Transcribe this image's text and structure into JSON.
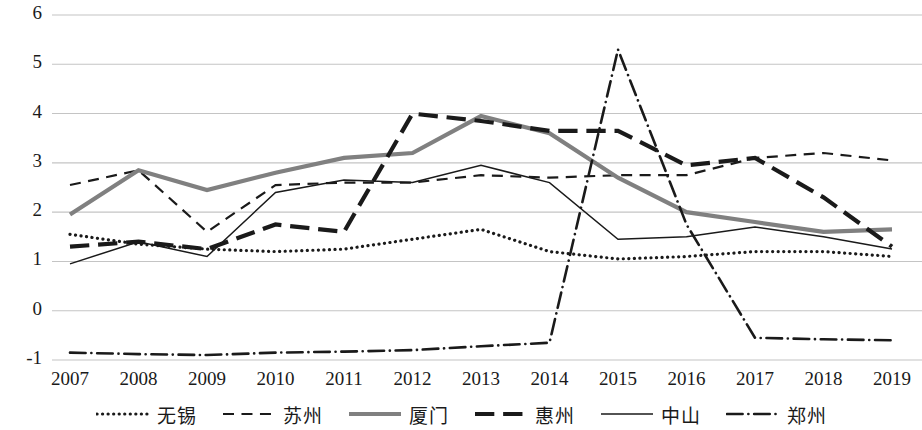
{
  "chart_data": {
    "type": "line",
    "title": "",
    "subtitle": "",
    "xlabel": "",
    "ylabel": "",
    "categories": [
      "2007",
      "2008",
      "2009",
      "2010",
      "2011",
      "2012",
      "2013",
      "2014",
      "2015",
      "2016",
      "2017",
      "2018",
      "2019"
    ],
    "x": [
      2007,
      2008,
      2009,
      2010,
      2011,
      2012,
      2013,
      2014,
      2015,
      2016,
      2017,
      2018,
      2019
    ],
    "ylim": [
      -1,
      6
    ],
    "yticks": [
      -1,
      0,
      1,
      2,
      3,
      4,
      5,
      6
    ],
    "ytick_labels": [
      "-1",
      "0",
      "1",
      "2",
      "3",
      "4",
      "5",
      "6"
    ],
    "grid": "horizontal",
    "legend_position": "bottom",
    "series": [
      {
        "name": "无锡",
        "style": "dotted",
        "color": "#1a1a1a",
        "width": 3.2,
        "values": [
          1.55,
          1.35,
          1.25,
          1.2,
          1.25,
          1.45,
          1.65,
          1.2,
          1.05,
          1.1,
          1.2,
          1.2,
          1.1
        ]
      },
      {
        "name": "苏州",
        "style": "dashed",
        "color": "#1a1a1a",
        "width": 2.2,
        "values": [
          2.55,
          2.85,
          1.6,
          2.55,
          2.6,
          2.6,
          2.75,
          2.7,
          2.75,
          2.75,
          3.1,
          3.2,
          3.05
        ]
      },
      {
        "name": "厦门",
        "style": "solid",
        "color": "#808080",
        "width": 4.2,
        "values": [
          1.95,
          2.85,
          2.45,
          2.8,
          3.1,
          3.2,
          3.95,
          3.6,
          2.7,
          2.0,
          1.8,
          1.6,
          1.65
        ]
      },
      {
        "name": "惠州",
        "style": "dashed-thick",
        "color": "#1a1a1a",
        "width": 4.2,
        "values": [
          1.3,
          1.4,
          1.25,
          1.75,
          1.6,
          4.0,
          3.85,
          3.65,
          3.65,
          2.95,
          3.1,
          2.3,
          1.3
        ]
      },
      {
        "name": "中山",
        "style": "solid-thin",
        "color": "#1a1a1a",
        "width": 1.5,
        "values": [
          0.95,
          1.4,
          1.1,
          2.4,
          2.65,
          2.6,
          2.95,
          2.6,
          1.45,
          1.5,
          1.7,
          1.5,
          1.25
        ]
      },
      {
        "name": "郑州",
        "style": "dash-dot",
        "color": "#1a1a1a",
        "width": 2.6,
        "values": [
          -0.85,
          -0.88,
          -0.9,
          -0.85,
          -0.83,
          -0.8,
          -0.72,
          -0.65,
          5.3,
          1.75,
          -0.55,
          -0.58,
          -0.6
        ]
      }
    ]
  },
  "axes": {
    "y_labels": [
      "6",
      "5",
      "4",
      "3",
      "2",
      "1",
      "0",
      "-1"
    ],
    "x_labels": [
      "2007",
      "2008",
      "2009",
      "2010",
      "2011",
      "2012",
      "2013",
      "2014",
      "2015",
      "2016",
      "2017",
      "2018",
      "2019"
    ]
  },
  "legend": {
    "items": [
      {
        "label": "无锡",
        "style": "dotted"
      },
      {
        "label": "苏州",
        "style": "dashed"
      },
      {
        "label": "厦门",
        "style": "solid"
      },
      {
        "label": "惠州",
        "style": "dashed-thick"
      },
      {
        "label": "中山",
        "style": "solid-thin"
      },
      {
        "label": "郑州",
        "style": "dash-dot"
      }
    ]
  },
  "colors": {
    "grid": "#c4c4c4",
    "text": "#1a1a1a",
    "accent_gray": "#808080",
    "background": "#ffffff"
  }
}
